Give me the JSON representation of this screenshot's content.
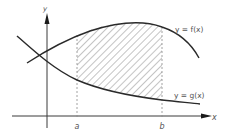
{
  "diagram": {
    "axes": {
      "x_label": "x",
      "y_label": "y"
    },
    "curves": [
      {
        "name": "f",
        "label": "y = f(x)"
      },
      {
        "name": "g",
        "label": "y = g(x)"
      }
    ],
    "bounds": {
      "a_label": "a",
      "b_label": "b"
    },
    "region": "shaded area between f(x) above and g(x) below, from x = a to x = b",
    "colors": {
      "line": "#2a2a2a",
      "hatch": "#555555",
      "dash": "#8a8a8a",
      "text": "#555555"
    }
  }
}
